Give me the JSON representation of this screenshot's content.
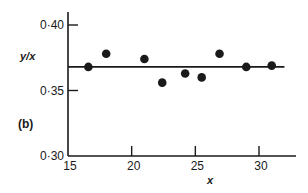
{
  "chart_data": {
    "type": "scatter",
    "title": "",
    "panel_label": "(b)",
    "xlabel": "x",
    "ylabel": "y/x",
    "xlim": [
      15,
      32.5
    ],
    "ylim": [
      0.3,
      0.41
    ],
    "x_ticks": [
      15,
      20,
      25,
      30
    ],
    "x_tick_labels": [
      "15",
      "20",
      "25",
      "30"
    ],
    "y_ticks": [
      0.3,
      0.35,
      0.4
    ],
    "y_tick_labels": [
      "0·30",
      "0·35",
      "0·40"
    ],
    "grid": false,
    "legend": null,
    "series": [
      {
        "name": "data",
        "marker": "filled-circle",
        "color": "#1a1a1a",
        "points": [
          {
            "x": 16.6,
            "y": 0.368
          },
          {
            "x": 18.0,
            "y": 0.378
          },
          {
            "x": 21.0,
            "y": 0.374
          },
          {
            "x": 22.4,
            "y": 0.356
          },
          {
            "x": 24.2,
            "y": 0.363
          },
          {
            "x": 25.5,
            "y": 0.36
          },
          {
            "x": 26.9,
            "y": 0.378
          },
          {
            "x": 29.0,
            "y": 0.368
          },
          {
            "x": 31.0,
            "y": 0.369
          }
        ]
      }
    ],
    "reference_lines": [
      {
        "type": "horizontal",
        "y": 0.368,
        "x_from": 15,
        "x_to": 32.0,
        "color": "#1a1a1a"
      }
    ]
  }
}
